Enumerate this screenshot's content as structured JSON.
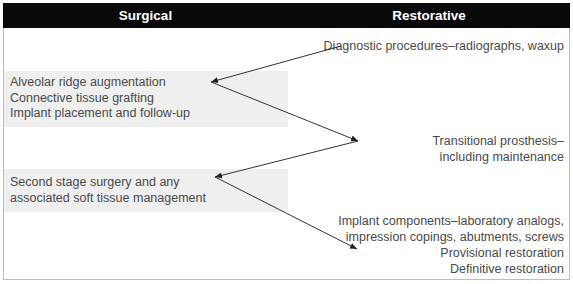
{
  "header": {
    "surgical": "Surgical",
    "restorative": "Restorative"
  },
  "surgical": [
    {
      "lines": [
        "Alveolar ridge augmentation",
        "Connective tissue grafting",
        "Implant placement and follow-up"
      ]
    },
    {
      "lines": [
        "Second stage surgery and any",
        "associated soft tissue management"
      ]
    }
  ],
  "restorative": [
    {
      "lines": [
        "Diagnostic procedures–radiographs, waxup"
      ]
    },
    {
      "lines": [
        "Transitional prosthesis–",
        "including maintenance"
      ]
    },
    {
      "lines": [
        "Implant components–laboratory analogs,",
        "impression copings, abutments, screws",
        "Provisional restoration",
        "Definitive restoration"
      ]
    }
  ],
  "colors": {
    "header_bg": "#0a0a0a",
    "box_bg": "#efefef",
    "text": "#4a4a4a",
    "arrow": "#333333"
  }
}
